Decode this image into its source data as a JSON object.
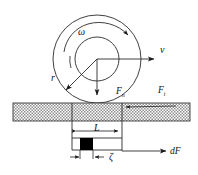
{
  "figure": {
    "background_color": "#ffffff",
    "line_color": "#1a1a1a",
    "hatch_color": "#8c8c8c",
    "block_color": "#000000",
    "labels": {
      "angular_velocity": "ω",
      "velocity": "v",
      "radius": "r",
      "normal_force": "F",
      "normal_force_sub": "n",
      "tangential_force": "F",
      "tangential_force_sub": "t",
      "contact_length": "L",
      "zeta": "ζ",
      "differential_force": "dF"
    }
  },
  "geometry": {
    "outer_circle": {
      "cx": 97,
      "cy": 59,
      "r": 44
    },
    "inner_circle": {
      "cx": 97,
      "cy": 59,
      "r": 22
    },
    "spiral_arc_label": "omega-spiral-arrow",
    "bar": {
      "x": 13,
      "y": 103,
      "width": 177,
      "height": 18
    },
    "contact_box": {
      "x": 72,
      "y": 121,
      "width": 50,
      "height": 29
    },
    "black_block": {
      "x": 80,
      "y": 138,
      "width": 13,
      "height": 12
    },
    "velocity_arrow": {
      "x1": 97,
      "y1": 59,
      "x2": 156,
      "y2": 59
    },
    "normal_arrow": {
      "x1": 97,
      "y1": 59,
      "x2": 97,
      "y2": 97
    },
    "radius_arrow": {
      "x1": 97,
      "y1": 59,
      "x2": 64,
      "y2": 92
    },
    "dF_arrow": {
      "x1": 122,
      "y1": 151,
      "x2": 167,
      "y2": 151
    },
    "ft_arrow": {
      "x1": 175,
      "y1": 106,
      "x2": 124,
      "y2": 108
    },
    "L_dimension": {
      "x1": 74,
      "y1": 131,
      "x2": 120,
      "y2": 131
    },
    "zeta_dimension": {
      "x1": 72,
      "y1": 156,
      "x2": 105,
      "y2": 156
    }
  }
}
